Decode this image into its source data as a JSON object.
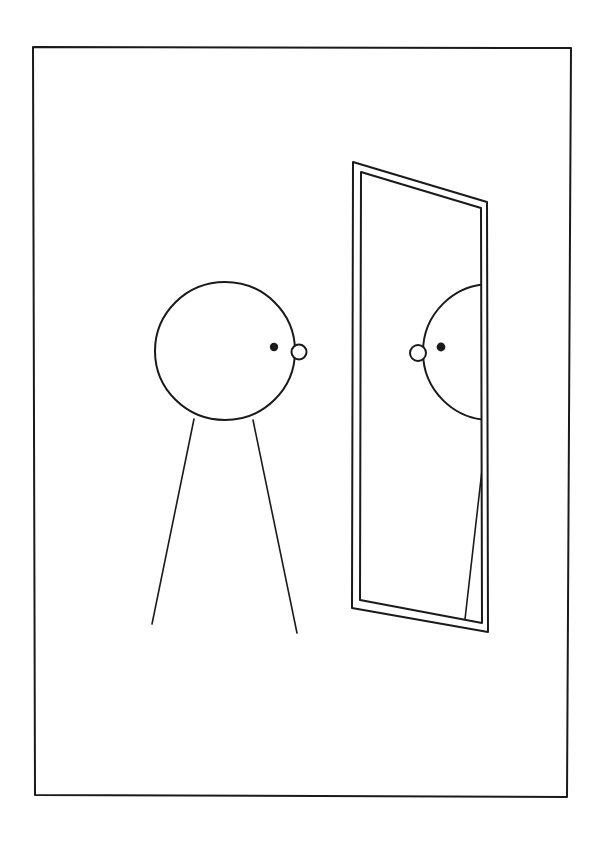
{
  "artwork": {
    "title": "Figure Facing a Mirror",
    "medium": "ink line drawing",
    "background_color": "#ffffff",
    "ink_color": "#1a1a1a",
    "canvas": {
      "width": 609,
      "height": 841
    }
  },
  "border": {
    "name": "page-border",
    "color": "#1a1a1a",
    "stroke_width": 2,
    "corners": {
      "top_left": [
        33,
        47
      ],
      "top_right": [
        571,
        48
      ],
      "bottom_right": [
        567,
        797
      ],
      "bottom_left": [
        35,
        795
      ]
    }
  },
  "figure": {
    "label": "stick figure",
    "head": {
      "name": "head-outline",
      "shape": "ellipse",
      "center": [
        225,
        351
      ],
      "radius_x": 70,
      "radius_y": 69,
      "stroke_width": 2
    },
    "eye": {
      "name": "eye-dot",
      "shape": "filled circle",
      "center": [
        274,
        347
      ],
      "radius": 4.2
    },
    "nose": {
      "name": "nose-circle",
      "shape": "open circle",
      "center": [
        299,
        352
      ],
      "radius": 7.5
    },
    "legs": [
      {
        "name": "left-leg",
        "from": [
          194,
          419
        ],
        "to": [
          152,
          624
        ],
        "stroke_width": 1.6
      },
      {
        "name": "right-leg",
        "from": [
          253,
          420
        ],
        "to": [
          297,
          633
        ],
        "stroke_width": 1.6
      }
    ]
  },
  "mirror": {
    "label": "tilted full-length mirror",
    "frame_outer": {
      "name": "mirror-frame-outer",
      "points": "353,162 487,202 488,632 352,608",
      "stroke_width": 2
    },
    "frame_inner": {
      "name": "mirror-frame-inner",
      "points": "361,172 481,208 482,623 360,600",
      "stroke_width": 2
    },
    "glass": {
      "name": "mirror-glass",
      "points": "361,172 481,208 482,623 360,600"
    },
    "reflection": {
      "label": "reflected figure (partially visible)",
      "head_arc": {
        "name": "reflected-head-arc",
        "description": "left portion of head circle, clipped by mirror inner right edge",
        "center": [
          491,
          352
        ],
        "radius_x": 68,
        "radius_y": 68,
        "clip_x": 483
      },
      "eye": {
        "name": "reflected-eye-dot",
        "center": [
          441,
          347
        ],
        "radius": 4.4
      },
      "nose": {
        "name": "reflected-nose-circle",
        "center": [
          418,
          353
        ],
        "radius": 8.0
      },
      "leg": {
        "name": "reflected-leg",
        "from": [
          482,
          470
        ],
        "to": [
          464,
          628
        ],
        "stroke_width": 1.6
      }
    }
  }
}
